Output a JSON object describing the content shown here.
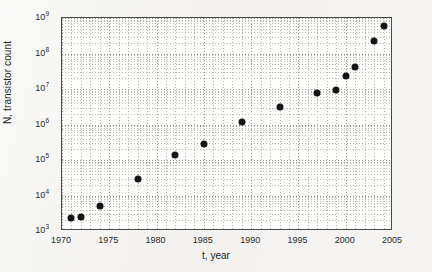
{
  "chart_data": {
    "type": "scatter",
    "title": "",
    "xlabel": "t, year",
    "ylabel": "N, transistor count",
    "xlim": [
      1970,
      2005
    ],
    "ylim": [
      1000,
      1000000000
    ],
    "yscale": "log",
    "xscale": "linear",
    "grid": true,
    "grid_style": "dotted-minor-and-major",
    "legend": "none",
    "xticks": [
      "1970",
      "1975",
      "1980",
      "1985",
      "1990",
      "1995",
      "2000",
      "2005"
    ],
    "xtick_values": [
      1970,
      1975,
      1980,
      1985,
      1990,
      1995,
      2000,
      2005
    ],
    "ytick_labels": [
      "10³",
      "10⁴",
      "10⁵",
      "10⁶",
      "10⁷",
      "10⁸",
      "10⁹"
    ],
    "ytick_mantissa": [
      "10",
      "10",
      "10",
      "10",
      "10",
      "10",
      "10"
    ],
    "ytick_exponents": [
      "3",
      "4",
      "5",
      "6",
      "7",
      "8",
      "9"
    ],
    "ytick_values": [
      1000,
      10000,
      100000,
      1000000,
      10000000,
      100000000,
      1000000000
    ],
    "x": [
      1971,
      1972,
      1974,
      1978,
      1982,
      1985,
      1989,
      1993,
      1997,
      1999,
      2000,
      2001,
      2003,
      2004
    ],
    "y": [
      2300,
      2500,
      5000,
      29000,
      134000,
      275000,
      1200000,
      3100000,
      7500000,
      9500000,
      24000000,
      42000000,
      220000000,
      590000000
    ],
    "marker": "filled-circle",
    "marker_color": "#141414",
    "marker_size_px": 7,
    "series": [
      {
        "name": "transistor count",
        "points": [
          {
            "x": 1971,
            "y": 2300
          },
          {
            "x": 1972,
            "y": 2500
          },
          {
            "x": 1974,
            "y": 5000
          },
          {
            "x": 1978,
            "y": 29000
          },
          {
            "x": 1982,
            "y": 134000
          },
          {
            "x": 1985,
            "y": 275000
          },
          {
            "x": 1989,
            "y": 1200000
          },
          {
            "x": 1993,
            "y": 3100000
          },
          {
            "x": 1997,
            "y": 7500000
          },
          {
            "x": 1999,
            "y": 9500000
          },
          {
            "x": 2000,
            "y": 24000000
          },
          {
            "x": 2001,
            "y": 42000000
          },
          {
            "x": 2003,
            "y": 220000000
          },
          {
            "x": 2004,
            "y": 590000000
          }
        ]
      }
    ]
  },
  "colors": {
    "marker": "#141414",
    "axis": "#4a4a4a",
    "grid_minor": "#bcbab7",
    "grid_major": "#8d8c89",
    "plot_background": "#fdfdfc",
    "page_background": "#f3f2f0",
    "text": "#232323"
  }
}
